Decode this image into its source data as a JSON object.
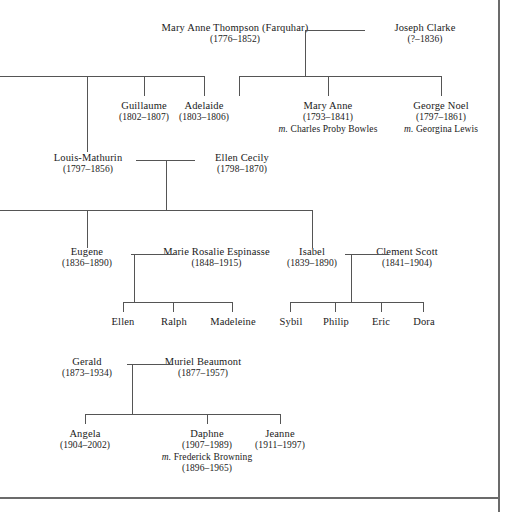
{
  "diagram": {
    "line_color": "#555555",
    "frame_color": "#6b6b6b",
    "background": "#ffffff"
  },
  "generations": {
    "g1": [
      {
        "name": "Mary Anne Thompson (Farquhar)",
        "dates": "(1776–1852)"
      },
      {
        "name": "Joseph Clarke",
        "dates": "(?–1836)"
      }
    ],
    "g2": [
      {
        "name": "Guillaume",
        "dates": "(1802–1807)"
      },
      {
        "name": "Adelaide",
        "dates": "(1803–1806)"
      },
      {
        "name": "Mary Anne",
        "dates": "(1793–1841)",
        "marriage_prefix": "m.",
        "spouse": "Charles Proby Bowles"
      },
      {
        "name": "George Noel",
        "dates": "(1797–1861)",
        "marriage_prefix": "m.",
        "spouse": "Georgina Lewis"
      }
    ],
    "g3": [
      {
        "name": "Louis-Mathurin",
        "dates": "(1797–1856)"
      },
      {
        "name": "Ellen Cecily",
        "dates": "(1798–1870)"
      }
    ],
    "g4": [
      {
        "name": "Eugene",
        "dates": "(1836–1890)"
      },
      {
        "name": "Marie Rosalie Espinasse",
        "dates": "(1848–1915)"
      },
      {
        "name": "Isabel",
        "dates": "(1839–1890)"
      },
      {
        "name": "Clement Scott",
        "dates": "(1841–1904)"
      }
    ],
    "g5": [
      {
        "name": "Ellen"
      },
      {
        "name": "Ralph"
      },
      {
        "name": "Madeleine"
      },
      {
        "name": "Sybil"
      },
      {
        "name": "Philip"
      },
      {
        "name": "Eric"
      },
      {
        "name": "Dora"
      }
    ],
    "g6": [
      {
        "name": "Gerald",
        "dates": "(1873–1934)"
      },
      {
        "name": "Muriel Beaumont",
        "dates": "(1877–1957)"
      }
    ],
    "g7": [
      {
        "name": "Angela",
        "dates": "(1904–2002)"
      },
      {
        "name": "Daphne",
        "dates": "(1907–1989)",
        "marriage_prefix": "m.",
        "spouse": "Frederick Browning",
        "spouse_dates": "(1896–1965)"
      },
      {
        "name": "Jeanne",
        "dates": "(1911–1997)"
      }
    ]
  }
}
